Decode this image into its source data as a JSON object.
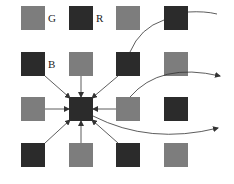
{
  "diagram": {
    "title": "",
    "colors": {
      "gray": "#7d7d7d",
      "dark": "#2b2b2b",
      "line": "#333333"
    },
    "grid": {
      "cols_x": [
        21,
        69,
        116,
        164
      ],
      "rows_y": [
        6,
        52,
        97,
        143
      ],
      "size": 24,
      "cells": [
        [
          "gray",
          "dark",
          "gray",
          "dark"
        ],
        [
          "dark",
          "gray",
          "dark",
          "gray"
        ],
        [
          "gray",
          "dark",
          "gray",
          "dark"
        ],
        [
          "dark",
          "gray",
          "dark",
          "gray"
        ]
      ]
    },
    "labels": [
      {
        "text": "G",
        "x": 48,
        "y": 13
      },
      {
        "text": "R",
        "x": 96,
        "y": 13
      },
      {
        "text": "B",
        "x": 48,
        "y": 59
      }
    ],
    "center": {
      "row": 2,
      "col": 1
    },
    "curves": [
      {
        "id": "curve-top",
        "from": "row1-col3 top / row0-col3",
        "to": "right edge",
        "arrowhead": false
      },
      {
        "id": "curve-middle",
        "from": "row2-col2",
        "to": "right edge",
        "arrowhead": true
      },
      {
        "id": "curve-bottom",
        "from": "center",
        "to": "right edge",
        "arrowhead": true
      }
    ]
  }
}
